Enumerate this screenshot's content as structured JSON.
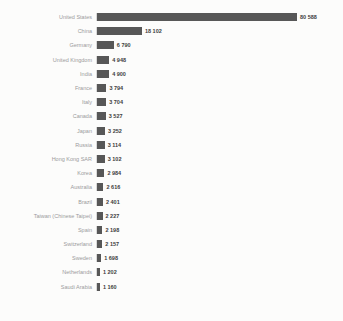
{
  "chart_data": {
    "type": "bar",
    "orientation": "horizontal",
    "title": "",
    "xlabel": "",
    "ylabel": "",
    "grid": false,
    "legend": false,
    "sort": "descending",
    "value_format": "thousands separated by space",
    "xlim": [
      0,
      86000
    ],
    "categories": [
      "United States",
      "China",
      "Germany",
      "United Kingdom",
      "India",
      "France",
      "Italy",
      "Canada",
      "Japan",
      "Russia",
      "Hong Kong SAR",
      "Korea",
      "Australia",
      "Brazil",
      "Taiwan (Chinese Taipei)",
      "Spain",
      "Switzerland",
      "Sweden",
      "Netherlands",
      "Saudi Arabia"
    ],
    "values": [
      80588,
      18102,
      6790,
      4948,
      4900,
      3794,
      3704,
      3527,
      3252,
      3114,
      3102,
      2984,
      2616,
      2401,
      2227,
      2198,
      2157,
      1698,
      1202,
      1160
    ],
    "value_labels": [
      "80 588",
      "18 102",
      "6 790",
      "4 948",
      "4 900",
      "3 794",
      "3 704",
      "3 527",
      "3 252",
      "3 114",
      "3 102",
      "2 984",
      "2 616",
      "2 401",
      "2 227",
      "2 198",
      "2 157",
      "1 698",
      "1 202",
      "1 160"
    ],
    "colors": {
      "bar": "#575757",
      "category_label": "#9b9b9b",
      "value_label": "#3d3d3d",
      "axis_line": "#d9d9d9",
      "background": "#fcfcfb"
    }
  }
}
